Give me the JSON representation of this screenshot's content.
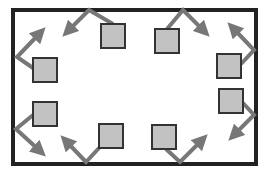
{
  "diagram": {
    "colors": {
      "background": "#ffffff",
      "frame": "#222222",
      "square_fill": "#c2c2c2",
      "square_stroke": "#333333",
      "arrow": "#777777"
    },
    "frame": {
      "x": 13,
      "y": 10,
      "w": 243,
      "h": 154,
      "stroke_width": 4
    },
    "square_size": 24,
    "items": [
      {
        "id": "top-left",
        "square": [
          101,
          24
        ],
        "arrow": [
          [
            113,
            24
          ],
          [
            89,
            10
          ],
          [
            68,
            31
          ]
        ]
      },
      {
        "id": "top-right",
        "square": [
          155,
          29
        ],
        "arrow": [
          [
            167,
            29
          ],
          [
            183,
            10
          ],
          [
            204,
            31
          ]
        ]
      },
      {
        "id": "left-upper",
        "square": [
          33,
          58
        ],
        "arrow": [
          [
            33,
            68
          ],
          [
            17,
            57
          ],
          [
            40,
            33
          ]
        ]
      },
      {
        "id": "right-upper",
        "square": [
          217,
          54
        ],
        "arrow": [
          [
            241,
            64
          ],
          [
            254,
            50
          ],
          [
            233,
            28
          ]
        ]
      },
      {
        "id": "left-lower",
        "square": [
          33,
          102
        ],
        "arrow": [
          [
            33,
            115
          ],
          [
            16,
            129
          ],
          [
            40,
            151
          ]
        ]
      },
      {
        "id": "right-lower",
        "square": [
          219,
          89
        ],
        "arrow": [
          [
            243,
            103
          ],
          [
            254,
            115
          ],
          [
            234,
            135
          ]
        ]
      },
      {
        "id": "bottom-left",
        "square": [
          99,
          124
        ],
        "arrow": [
          [
            99,
            148
          ],
          [
            86,
            162
          ],
          [
            66,
            141
          ]
        ]
      },
      {
        "id": "bottom-right",
        "square": [
          152,
          125
        ],
        "arrow": [
          [
            166,
            149
          ],
          [
            180,
            162
          ],
          [
            202,
            140
          ]
        ]
      }
    ]
  }
}
